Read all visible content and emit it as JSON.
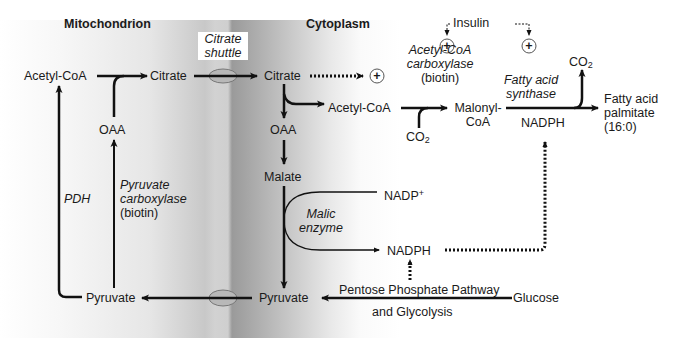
{
  "regions": {
    "left": "Mitochondrion",
    "right": "Cytoplasm"
  },
  "shuttle": {
    "line1": "Citrate",
    "line2": "shuttle"
  },
  "metabolites": {
    "mito_acetyl_coa": "Acetyl-CoA",
    "mito_citrate": "Citrate",
    "mito_oaa": "OAA",
    "mito_pyruvate": "Pyruvate",
    "cyto_citrate": "Citrate",
    "cyto_acetyl_coa": "Acetyl-CoA",
    "cyto_oaa": "OAA",
    "malate": "Malate",
    "malonyl_coa_1": "Malonyl-",
    "malonyl_coa_2": "CoA",
    "co2_in": "CO",
    "co2_out": "CO",
    "co2_sub": "2",
    "fatty_acid_1": "Fatty acid",
    "fatty_acid_2": "palmitate",
    "fatty_acid_3": "(16:0)",
    "nadph_fas": "NADPH",
    "nadp_plus": "NADP",
    "nadp_sup": "+",
    "nadph_malic": "NADPH",
    "cyto_pyruvate": "Pyruvate",
    "glucose": "Glucose"
  },
  "enzymes": {
    "pdh": "PDH",
    "pyruvate_carboxylase_1": "Pyruvate",
    "pyruvate_carboxylase_2": "carboxylase",
    "pyruvate_carboxylase_3": "(biotin)",
    "acc_1": "Acetyl-CoA",
    "acc_2": "carboxylase",
    "acc_3": "(biotin)",
    "fas_1": "Fatty acid",
    "fas_2": "synthase",
    "malic_1": "Malic",
    "malic_2": "enzyme"
  },
  "regulation": {
    "insulin": "Insulin",
    "activator_symbol": "+"
  },
  "pathways": {
    "ppp_1": "Pentose Phosphate Pathway",
    "ppp_2": "and Glycolysis"
  },
  "colors": {
    "line": "#111111",
    "membrane_oval": "#a0a0a0"
  }
}
